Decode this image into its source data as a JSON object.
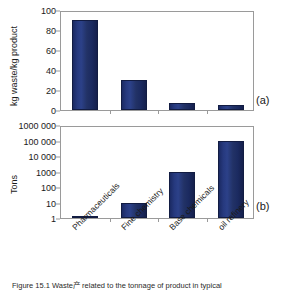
{
  "figure": {
    "caption": "Figure 15.1 Waste产 related to the tonnage of product in typical"
  },
  "chart_data": [
    {
      "type": "bar",
      "panel": "(a)",
      "title": "",
      "xlabel": "",
      "ylabel": "kg waste/kg product",
      "categories": [
        "Pharmaceuticals",
        "Fine chemistry",
        "Base chemicals",
        "oil refinery"
      ],
      "values": [
        90,
        30,
        7,
        5
      ],
      "yticks": [
        "0",
        "20",
        "40",
        "60",
        "80",
        "100"
      ],
      "ylim": [
        0,
        100
      ],
      "yscale": "linear",
      "grid": false,
      "legend": "none",
      "bar_color": "#22337a"
    },
    {
      "type": "bar",
      "panel": "(b)",
      "title": "",
      "xlabel": "",
      "ylabel": "Tons",
      "categories": [
        "Pharmaceuticals",
        "Fine chemistry",
        "Base chemicals",
        "oil refinery"
      ],
      "values": [
        1.4,
        10,
        1000,
        100000
      ],
      "yticks": [
        "1",
        "10",
        "100",
        "1000",
        "10 000",
        "100 000",
        "1000 000"
      ],
      "ylim": [
        1,
        1000000
      ],
      "yscale": "log",
      "grid": false,
      "legend": "none",
      "bar_color": "#22337a"
    }
  ]
}
